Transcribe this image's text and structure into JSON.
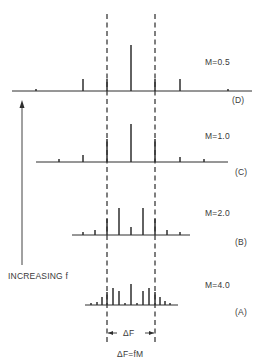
{
  "diagram": {
    "type": "fm-frequency-spectra",
    "carrier_x": 131,
    "deviation_markers": {
      "left_x": 107,
      "right_x": 155,
      "top_y": 14,
      "bottom_y": 343
    },
    "spectra": [
      {
        "id": "D",
        "label": "(D)",
        "m_label": "M=0.5",
        "baseline_y": 91,
        "baseline_x": [
          12,
          252
        ],
        "lines": [
          {
            "x": 36,
            "h": 2
          },
          {
            "x": 83,
            "h": 12
          },
          {
            "x": 107,
            "h": 12
          },
          {
            "x": 131,
            "h": 46
          },
          {
            "x": 155,
            "h": 12
          },
          {
            "x": 180,
            "h": 12
          },
          {
            "x": 228,
            "h": 2
          }
        ],
        "m_label_pos": [
          205,
          57
        ],
        "id_label_pos": [
          232,
          95
        ]
      },
      {
        "id": "C",
        "label": "(C)",
        "m_label": "M=1.0",
        "baseline_y": 162,
        "baseline_x": [
          36,
          228
        ],
        "lines": [
          {
            "x": 59,
            "h": 3
          },
          {
            "x": 83,
            "h": 7
          },
          {
            "x": 107,
            "h": 23
          },
          {
            "x": 131,
            "h": 38
          },
          {
            "x": 155,
            "h": 23
          },
          {
            "x": 180,
            "h": 5
          },
          {
            "x": 204,
            "h": 3
          }
        ],
        "m_label_pos": [
          205,
          131
        ],
        "id_label_pos": [
          235,
          167
        ]
      },
      {
        "id": "B",
        "label": "(B)",
        "m_label": "M=2.0",
        "baseline_y": 235,
        "baseline_x": [
          72,
          190
        ],
        "lines": [
          {
            "x": 83,
            "h": 3
          },
          {
            "x": 95,
            "h": 5
          },
          {
            "x": 107,
            "h": 16
          },
          {
            "x": 119,
            "h": 27
          },
          {
            "x": 131,
            "h": 8
          },
          {
            "x": 143,
            "h": 27
          },
          {
            "x": 155,
            "h": 16
          },
          {
            "x": 167,
            "h": 5
          },
          {
            "x": 180,
            "h": 3
          }
        ],
        "m_label_pos": [
          205,
          208
        ],
        "id_label_pos": [
          235,
          237
        ]
      },
      {
        "id": "A",
        "label": "(A)",
        "m_label": "M=4.0",
        "baseline_y": 305,
        "baseline_x": [
          85,
          178
        ],
        "lines": [
          {
            "x": 91,
            "h": 2
          },
          {
            "x": 97,
            "h": 3
          },
          {
            "x": 102,
            "h": 8
          },
          {
            "x": 107,
            "h": 13
          },
          {
            "x": 113,
            "h": 17
          },
          {
            "x": 119,
            "h": 14
          },
          {
            "x": 125,
            "h": 2
          },
          {
            "x": 131,
            "h": 21
          },
          {
            "x": 137,
            "h": 2
          },
          {
            "x": 143,
            "h": 14
          },
          {
            "x": 149,
            "h": 17
          },
          {
            "x": 155,
            "h": 13
          },
          {
            "x": 160,
            "h": 8
          },
          {
            "x": 165,
            "h": 4
          },
          {
            "x": 170,
            "h": 2
          }
        ],
        "m_label_pos": [
          205,
          280
        ],
        "id_label_pos": [
          235,
          307
        ]
      }
    ],
    "increasing_arrow": {
      "x": 22,
      "top_y": 100,
      "bottom_y": 265,
      "label": "INCREASING f",
      "label_pos": [
        8,
        271
      ]
    },
    "delta_f": {
      "label": "ΔF",
      "y": 333,
      "label_pos": [
        122,
        328
      ]
    },
    "formula": {
      "label": "ΔF=fM",
      "label_pos": [
        117,
        349
      ]
    },
    "colors": {
      "ink": "#2e2e2e",
      "dash": "#3a3a3a",
      "background": "#ffffff"
    }
  }
}
